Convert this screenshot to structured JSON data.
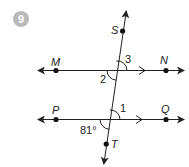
{
  "problem": {
    "number": "9",
    "badge_color": "#b9b9b9"
  },
  "diagram": {
    "points": {
      "M": "M",
      "N": "N",
      "P": "P",
      "Q": "Q",
      "S": "S",
      "T": "T"
    },
    "angles": {
      "angle_1": "1",
      "angle_2": "2",
      "angle_3": "3",
      "given": "81°"
    },
    "lines": [
      {
        "name": "line-MN",
        "parallel_marker": ">"
      },
      {
        "name": "line-PQ",
        "parallel_marker": ">"
      },
      {
        "name": "transversal-ST"
      }
    ],
    "line_color": "#222222"
  }
}
